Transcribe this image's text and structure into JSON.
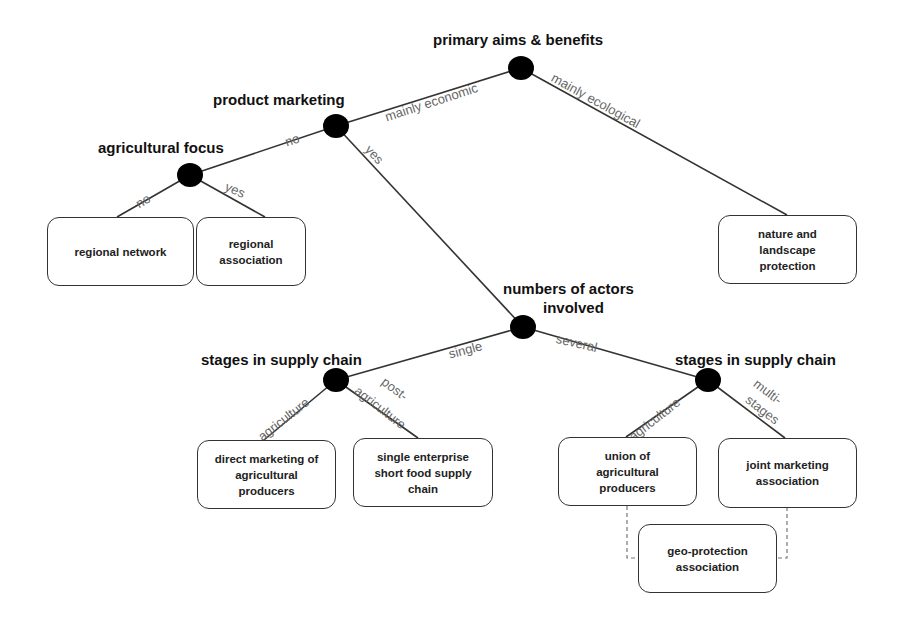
{
  "decision_nodes": {
    "primary_aims": {
      "title": "primary aims & benefits"
    },
    "product_marketing": {
      "title": "product marketing"
    },
    "agricultural_focus": {
      "title": "agricultural focus"
    },
    "number_of_actors": {
      "title": "numbers of actors involved",
      "title_line1": "numbers of actors",
      "title_line2": "involved"
    },
    "stages_single": {
      "title": "stages in supply chain"
    },
    "stages_several": {
      "title": "stages in supply chain"
    }
  },
  "edge_labels": {
    "mainly_economic": "mainly economic",
    "mainly_ecological": "mainly ecological",
    "product_marketing_no": "no",
    "product_marketing_yes": "yes",
    "agri_focus_no": "no",
    "agri_focus_yes": "yes",
    "single": "single",
    "several": "several",
    "single_agriculture": "agriculture",
    "single_post_agriculture_line1": "post-",
    "single_post_agriculture_line2": "agriculture",
    "several_agriculture": "agriculture",
    "several_multi_line1": "multi-",
    "several_multi_line2": "stages"
  },
  "outcomes": {
    "regional_network": {
      "lines": [
        "regional network"
      ]
    },
    "regional_association": {
      "lines": [
        "regional",
        "association"
      ]
    },
    "nature_landscape": {
      "lines": [
        "nature and",
        "landscape",
        "protection"
      ]
    },
    "direct_marketing": {
      "lines": [
        "direct marketing of",
        "agricultural",
        "producers"
      ]
    },
    "single_enterprise": {
      "lines": [
        "single enterprise",
        "short food supply",
        "chain"
      ]
    },
    "union_agri": {
      "lines": [
        "union of",
        "agricultural",
        "producers"
      ]
    },
    "joint_marketing": {
      "lines": [
        "joint marketing",
        "association"
      ]
    },
    "geo_protection": {
      "lines": [
        "geo-protection",
        "association"
      ]
    }
  },
  "colors": {
    "node_fill": "#000000",
    "edge": "#333333",
    "edge_label": "#666666",
    "dashed_connector": "#777777"
  }
}
